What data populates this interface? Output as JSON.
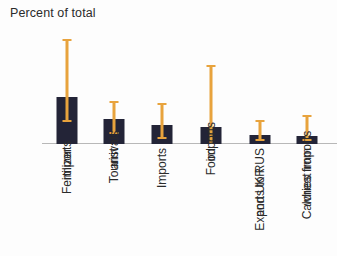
{
  "chart_data": {
    "type": "bar",
    "title": "Percent of total",
    "xlabel": "",
    "ylabel": "Percent of total",
    "ylim": [
      0,
      60
    ],
    "yticks": [
      0,
      20,
      40,
      60
    ],
    "grid": false,
    "legend": null,
    "bar_color": "#232437",
    "error_color": "#e8a33d",
    "categories": [
      "Fertilizer imports",
      "Tourist arrivals",
      "Imports",
      "Food imports",
      "Exports to RUS and UKR",
      "Calories from wheat imports"
    ],
    "category_lines": [
      [
        "Fertilizer",
        "imports"
      ],
      [
        "Tourist",
        "arrivals"
      ],
      [
        "Imports",
        ""
      ],
      [
        "Food",
        "imports"
      ],
      [
        "Exports to RUS",
        "and UKR"
      ],
      [
        "Calories from",
        "wheat imports"
      ]
    ],
    "values": [
      25,
      13,
      10,
      9,
      5,
      4
    ],
    "error_low": [
      12,
      6,
      3,
      0,
      2,
      2
    ],
    "error_high": [
      55,
      22,
      21,
      41,
      12,
      15
    ],
    "series": [
      {
        "name": "Percent of total",
        "values": [
          25,
          13,
          10,
          9,
          5,
          4
        ]
      }
    ]
  },
  "axis": {
    "y_tick_labels": [
      "60",
      "40",
      "20",
      "0"
    ],
    "y_tick_values": [
      60,
      40,
      20,
      0
    ]
  }
}
